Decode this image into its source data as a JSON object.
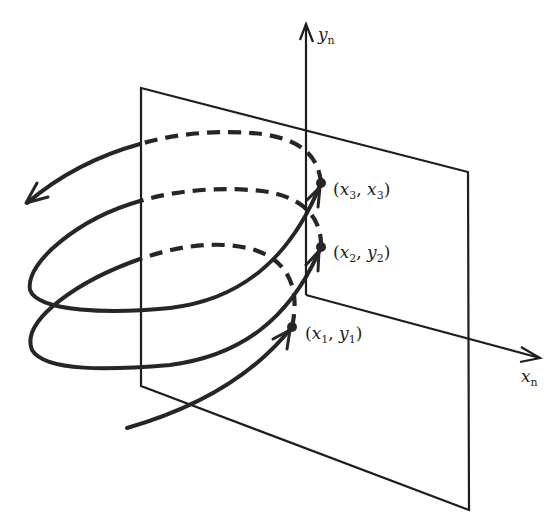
{
  "figure": {
    "axes": {
      "y_axis": {
        "label": "y",
        "subscript": "n"
      },
      "x_axis": {
        "label": "x",
        "subscript": "n"
      }
    },
    "points": [
      {
        "id": "p1",
        "label_open": "(",
        "var1": "x",
        "sub1": "1",
        "sep": ", ",
        "var2": "y",
        "sub2": "1",
        "label_close": ")"
      },
      {
        "id": "p2",
        "label_open": "(",
        "var1": "x",
        "sub1": "2",
        "sep": ", ",
        "var2": "y",
        "sub2": "2",
        "label_close": ")"
      },
      {
        "id": "p3",
        "label_open": "(",
        "var1": "x",
        "sub1": "3",
        "sep": ", ",
        "var2": "x",
        "sub2": "3",
        "label_close": ")"
      }
    ],
    "colors": {
      "ink": "#262626",
      "background": "#ffffff"
    }
  }
}
